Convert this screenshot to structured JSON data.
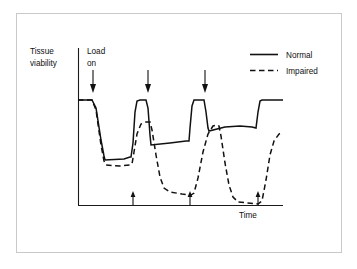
{
  "chart_data": {
    "type": "line",
    "title": "",
    "xlabel": "Time",
    "ylabel_line1": "Tissue",
    "ylabel_line2": "viability",
    "grid": false,
    "axis_ticks": false,
    "legend_position": "top-right",
    "annotations": [
      {
        "name": "load-on",
        "text_line1": "Load",
        "text_line2": "on",
        "x": 93,
        "marker": "down-arrow"
      },
      {
        "name": "load-on-2",
        "text_line1": "",
        "text_line2": "",
        "x": 148,
        "marker": "down-arrow"
      },
      {
        "name": "load-on-3",
        "text_line1": "",
        "text_line2": "",
        "x": 205,
        "marker": "down-arrow"
      }
    ],
    "down_arrow_x": [
      93,
      148,
      205
    ],
    "up_arrow_x": [
      133,
      190,
      258
    ],
    "xlim": [
      78,
      283
    ],
    "ylim_top": 100,
    "ylim_bottom": 205,
    "baseline_value": 100,
    "series": [
      {
        "name": "Normal",
        "style": "solid",
        "points": [
          [
            78,
            100
          ],
          [
            92,
            100
          ],
          [
            96,
            108
          ],
          [
            101,
            140
          ],
          [
            104,
            156
          ],
          [
            105,
            160
          ],
          [
            124,
            159
          ],
          [
            130,
            157
          ],
          [
            131,
            157
          ],
          [
            133,
            143
          ],
          [
            135,
            112
          ],
          [
            137,
            101
          ],
          [
            140,
            100
          ],
          [
            146,
            100
          ],
          [
            148,
            108
          ],
          [
            150,
            135
          ],
          [
            151,
            145
          ],
          [
            170,
            143
          ],
          [
            186,
            141
          ],
          [
            189,
            141
          ],
          [
            190,
            128
          ],
          [
            192,
            106
          ],
          [
            194,
            100
          ],
          [
            200,
            100
          ],
          [
            204,
            100
          ],
          [
            206,
            112
          ],
          [
            208,
            128
          ],
          [
            209,
            131
          ],
          [
            225,
            127
          ],
          [
            240,
            126
          ],
          [
            252,
            127
          ],
          [
            256,
            128
          ],
          [
            258,
            112
          ],
          [
            260,
            101
          ],
          [
            262,
            100
          ],
          [
            283,
            100
          ]
        ]
      },
      {
        "name": "Impaired",
        "style": "dashed",
        "points": [
          [
            78,
            100
          ],
          [
            92,
            100
          ],
          [
            96,
            110
          ],
          [
            101,
            145
          ],
          [
            104,
            161
          ],
          [
            106,
            165
          ],
          [
            120,
            166
          ],
          [
            130,
            165
          ],
          [
            132,
            164
          ],
          [
            134,
            152
          ],
          [
            137,
            134
          ],
          [
            141,
            124
          ],
          [
            146,
            122
          ],
          [
            150,
            122
          ],
          [
            152,
            130
          ],
          [
            156,
            155
          ],
          [
            160,
            177
          ],
          [
            164,
            188
          ],
          [
            170,
            192
          ],
          [
            182,
            194
          ],
          [
            191,
            195
          ],
          [
            194,
            193
          ],
          [
            198,
            178
          ],
          [
            203,
            152
          ],
          [
            208,
            134
          ],
          [
            213,
            126
          ],
          [
            217,
            125
          ],
          [
            219,
            126
          ],
          [
            221,
            136
          ],
          [
            225,
            163
          ],
          [
            229,
            185
          ],
          [
            233,
            197
          ],
          [
            238,
            202
          ],
          [
            248,
            203
          ],
          [
            258,
            204
          ],
          [
            262,
            201
          ],
          [
            266,
            180
          ],
          [
            270,
            155
          ],
          [
            274,
            141
          ],
          [
            279,
            134
          ],
          [
            283,
            132
          ]
        ]
      }
    ],
    "legend": [
      {
        "label": "Normal",
        "style": "solid"
      },
      {
        "label": "Impaired",
        "style": "dashed"
      }
    ]
  },
  "colors": {
    "line": "#111111",
    "axis": "#1a1a1a",
    "border": "#c9c9c9",
    "background": "#ffffff"
  }
}
